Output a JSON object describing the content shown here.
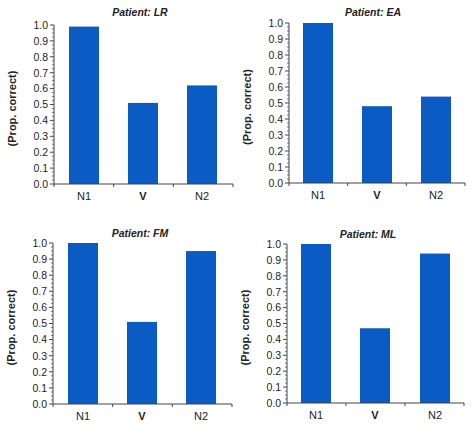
{
  "figure": {
    "bar_color": "#0a5bc4",
    "axis_color": "#444444"
  },
  "chart_data": [
    {
      "type": "bar",
      "title": "Patient: LR",
      "xlabel": "",
      "ylabel": "(Prop. correct)",
      "categories": [
        "N1",
        "V",
        "N2"
      ],
      "values": [
        0.99,
        0.51,
        0.62
      ],
      "ylim": [
        0,
        1.0
      ],
      "yticks": [
        "0.0",
        "0.1",
        "0.2",
        "0.3",
        "0.4",
        "0.5",
        "0.6",
        "0.7",
        "0.8",
        "0.9",
        "1.0"
      ],
      "grid": false,
      "legend": null
    },
    {
      "type": "bar",
      "title": "Patient: EA",
      "xlabel": "",
      "ylabel": "(Prop. correct)",
      "categories": [
        "N1",
        "V",
        "N2"
      ],
      "values": [
        1.0,
        0.48,
        0.54
      ],
      "ylim": [
        0,
        1.0
      ],
      "yticks": [
        "0.0",
        "0.1",
        "0.2",
        "0.3",
        "0.4",
        "0.5",
        "0.6",
        "0.7",
        "0.8",
        "0.9",
        "1.0"
      ],
      "grid": false,
      "legend": null
    },
    {
      "type": "bar",
      "title": "Patient: FM",
      "xlabel": "",
      "ylabel": "(Prop. correct)",
      "categories": [
        "N1",
        "V",
        "N2"
      ],
      "values": [
        1.0,
        0.51,
        0.95
      ],
      "ylim": [
        0,
        1.0
      ],
      "yticks": [
        "0.0",
        "0.1",
        "0.2",
        "0.3",
        "0.4",
        "0.5",
        "0.6",
        "0.7",
        "0.8",
        "0.9",
        "1.0"
      ],
      "grid": false,
      "legend": null
    },
    {
      "type": "bar",
      "title": "Patient: ML",
      "xlabel": "",
      "ylabel": "(Prop. correct)",
      "categories": [
        "N1",
        "V",
        "N2"
      ],
      "values": [
        1.0,
        0.47,
        0.94
      ],
      "ylim": [
        0,
        1.0
      ],
      "yticks": [
        "0.0",
        "0.1",
        "0.2",
        "0.3",
        "0.4",
        "0.5",
        "0.6",
        "0.7",
        "0.8",
        "0.9",
        "1.0"
      ],
      "grid": false,
      "legend": null
    }
  ]
}
